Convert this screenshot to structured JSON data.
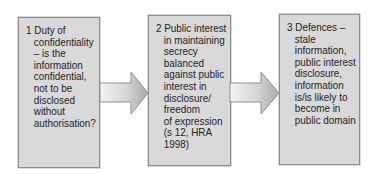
{
  "diagram": {
    "type": "flow",
    "direction": "left-to-right",
    "colors": {
      "box_fill": "#d9d9d9",
      "box_border": "#8c8c8c",
      "arrow_light": "#f2f2f2",
      "arrow_dark": "#a9a9a9",
      "text": "#1e1e1e"
    },
    "steps": [
      {
        "number": "1",
        "lines": [
          "1 Duty of",
          "confidentiality",
          "– is the",
          "information",
          "confidential,",
          "not to be",
          "disclosed",
          "without",
          "authorisation?"
        ]
      },
      {
        "number": "2",
        "lines": [
          "2 Public interest",
          "in maintaining",
          "secrecy",
          "balanced",
          "against public",
          "interest in",
          "disclosure/",
          "freedom",
          "of expression",
          "(s 12, HRA",
          "1998)"
        ]
      },
      {
        "number": "3",
        "lines": [
          "3 Defences –",
          "stale",
          "information,",
          "public interest",
          "disclosure,",
          "information",
          "is/is likely to",
          "become in",
          "public domain"
        ]
      }
    ],
    "arrows": [
      {
        "from": "1",
        "to": "2"
      },
      {
        "from": "2",
        "to": "3"
      }
    ]
  }
}
